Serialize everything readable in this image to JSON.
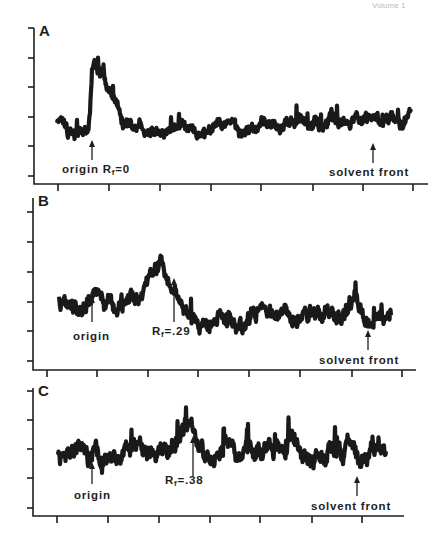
{
  "header": {
    "text": "Volume 1"
  },
  "chart_data": [
    {
      "type": "line",
      "panel": "A",
      "title": "A",
      "xlabel": "",
      "ylabel": "",
      "grid": false,
      "axis": {
        "x0": 34,
        "x1": 428,
        "y_top": 28,
        "y_axis": 184,
        "xticks": [
          58,
          109,
          160,
          211,
          261,
          313,
          363,
          413
        ],
        "yticks": [
          28,
          58,
          87,
          117,
          146,
          176
        ]
      },
      "trace": {
        "x_start": 57,
        "x_end": 411,
        "baseline": 127,
        "noise": 7,
        "seed": 11,
        "peaks": [
          {
            "x": 93,
            "height": 70,
            "width_left": 2,
            "width_right": 16
          }
        ],
        "drift": [
          [
            57,
            0
          ],
          [
            200,
            4
          ],
          [
            260,
            2
          ],
          [
            330,
            -6
          ],
          [
            411,
            -8
          ]
        ]
      },
      "annotations": [
        {
          "label": "origin Rf=0",
          "text": "origin R",
          "sub": "f",
          "suffix": "=0",
          "arrow_x": 92,
          "arrow_y0": 160,
          "arrow_y1": 140,
          "text_x": 62,
          "text_y": 173
        },
        {
          "label": "solvent front",
          "text": "solvent front",
          "arrow_x": 373,
          "arrow_y0": 163,
          "arrow_y1": 143,
          "text_x": 329,
          "text_y": 176
        }
      ]
    },
    {
      "type": "line",
      "panel": "B",
      "title": "B",
      "xlabel": "",
      "ylabel": "",
      "grid": false,
      "axis": {
        "x0": 33,
        "x1": 416,
        "y_top": 198,
        "y_axis": 370,
        "xticks": [
          47,
          97,
          148,
          198,
          249,
          300,
          352,
          402
        ],
        "yticks": [
          212,
          242,
          272,
          302,
          331,
          361
        ]
      },
      "trace": {
        "x_start": 59,
        "x_end": 391,
        "baseline": 308,
        "noise": 9,
        "seed": 23,
        "peaks": [
          {
            "x": 96,
            "height": 20,
            "width_left": 6,
            "width_right": 6
          },
          {
            "x": 163,
            "height": 48,
            "width_left": 22,
            "width_right": 10
          },
          {
            "x": 354,
            "height": 25,
            "width_left": 5,
            "width_right": 6
          }
        ],
        "drift": [
          [
            59,
            0
          ],
          [
            200,
            8
          ],
          [
            391,
            6
          ]
        ]
      },
      "annotations": [
        {
          "label": "origin",
          "text": "origin",
          "arrow_x": 92,
          "arrow_y0": 322,
          "arrow_y1": 296,
          "text_x": 73,
          "text_y": 340
        },
        {
          "label": "Rf=.29",
          "text": "R",
          "sub": "f",
          "suffix": "=.29",
          "arrow_x": 174,
          "arrow_y0": 322,
          "arrow_y1": 278,
          "text_x": 152,
          "text_y": 335
        },
        {
          "label": "solvent front",
          "text": "solvent front",
          "arrow_x": 368,
          "arrow_y0": 350,
          "arrow_y1": 330,
          "text_x": 319,
          "text_y": 364
        }
      ]
    },
    {
      "type": "line",
      "panel": "C",
      "title": "C",
      "xlabel": "",
      "ylabel": "",
      "grid": false,
      "axis": {
        "x0": 33,
        "x1": 404,
        "y_top": 388,
        "y_axis": 516,
        "xticks": [
          57,
          108,
          159,
          210,
          260,
          312,
          362
        ],
        "yticks": [
          391,
          420,
          449,
          478,
          508
        ]
      },
      "trace": {
        "x_start": 58,
        "x_end": 386,
        "baseline": 455,
        "noise": 10,
        "seed": 37,
        "peaks": [
          {
            "x": 80,
            "height": 12,
            "width_left": 4,
            "width_right": 4
          },
          {
            "x": 185,
            "height": 25,
            "width_left": 14,
            "width_right": 10
          }
        ],
        "drift": [
          [
            58,
            0
          ],
          [
            220,
            0
          ],
          [
            300,
            -6
          ],
          [
            386,
            -4
          ]
        ]
      },
      "annotations": [
        {
          "label": "origin",
          "text": "origin",
          "arrow_x": 92,
          "arrow_y0": 484,
          "arrow_y1": 462,
          "text_x": 74,
          "text_y": 499
        },
        {
          "label": "Rf=.38",
          "text": "R",
          "sub": "f",
          "suffix": "=.38",
          "arrow_x": 193,
          "arrow_y0": 476,
          "arrow_y1": 436,
          "text_x": 165,
          "text_y": 484
        },
        {
          "label": "solvent front",
          "text": "solvent front",
          "arrow_x": 357,
          "arrow_y0": 496,
          "arrow_y1": 476,
          "text_x": 311,
          "text_y": 510
        }
      ]
    }
  ]
}
